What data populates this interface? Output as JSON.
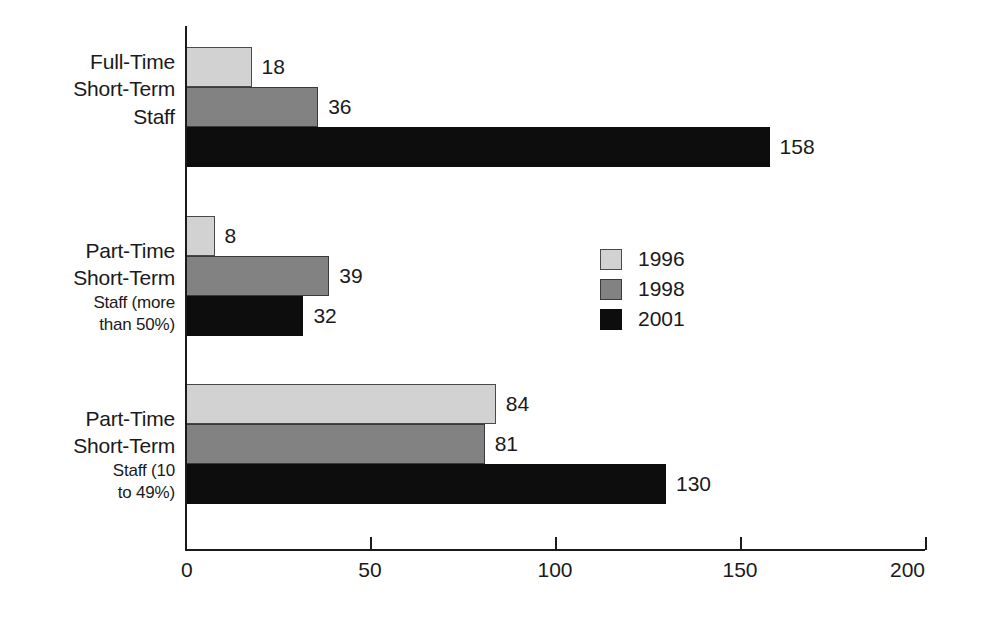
{
  "chart_data": {
    "type": "bar",
    "orientation": "horizontal",
    "title": "",
    "subtitle": "",
    "xlabel": "",
    "ylabel": "",
    "xlim": [
      0,
      200
    ],
    "xticks": [
      0,
      50,
      100,
      150,
      200
    ],
    "xtick_labels": [
      "0",
      "50",
      "100",
      "150",
      "200"
    ],
    "grid": false,
    "legend_position": "center-right",
    "categories": [
      "Full-Time Short-Term Staff",
      "Part-Time Short-Term Staff (more than 50%)",
      "Part-Time Short-Term Staff (10 to 49%)"
    ],
    "category_label_lines": [
      [
        {
          "text": "Full-Time",
          "emphasis": "large"
        },
        {
          "text": "Short-Term",
          "emphasis": "large"
        },
        {
          "text": "Staff",
          "emphasis": "large"
        }
      ],
      [
        {
          "text": "Part-Time",
          "emphasis": "large"
        },
        {
          "text": "Short-Term",
          "emphasis": "large"
        },
        {
          "text": "Staff (more",
          "emphasis": "small"
        },
        {
          "text": "than 50%)",
          "emphasis": "small"
        }
      ],
      [
        {
          "text": "Part-Time",
          "emphasis": "large"
        },
        {
          "text": "Short-Term",
          "emphasis": "large"
        },
        {
          "text": "Staff (10",
          "emphasis": "small"
        },
        {
          "text": "to 49%)",
          "emphasis": "small"
        }
      ]
    ],
    "series": [
      {
        "name": "1996",
        "color": "#d2d2d2",
        "values": [
          18,
          8,
          84
        ]
      },
      {
        "name": "1998",
        "color": "#828282",
        "values": [
          36,
          39,
          81
        ]
      },
      {
        "name": "2001",
        "color": "#0d0d0d",
        "values": [
          158,
          32,
          130
        ]
      }
    ],
    "data_labels": [
      [
        "18",
        "36",
        "158"
      ],
      [
        "8",
        "39",
        "32"
      ],
      [
        "84",
        "81",
        "130"
      ]
    ],
    "legend_entries": [
      {
        "label": "1996",
        "color": "#d2d2d2"
      },
      {
        "label": "1998",
        "color": "#828282"
      },
      {
        "label": "2001",
        "color": "#0d0d0d"
      }
    ],
    "colors": {
      "axis": "#1a1a1a",
      "text": "#1a1a1a",
      "background": "#ffffff"
    }
  }
}
